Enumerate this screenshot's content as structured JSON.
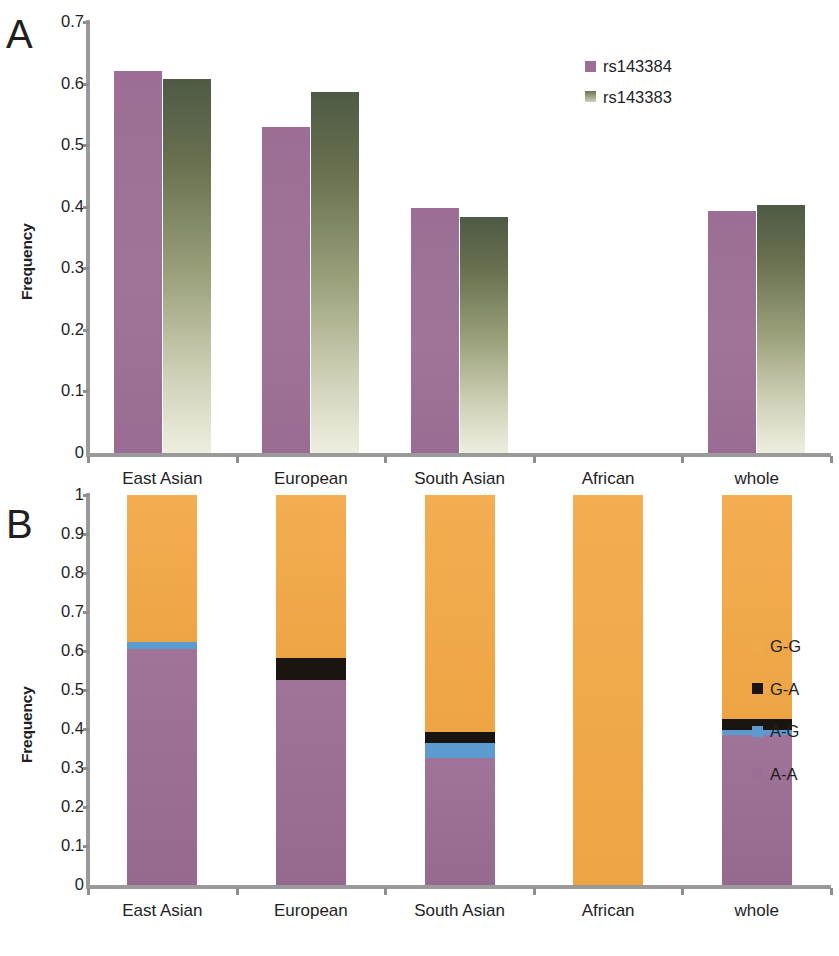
{
  "figure": {
    "panels": [
      {
        "letter": "A",
        "ylabel": "Frequency"
      },
      {
        "letter": "B",
        "ylabel": "Frequency"
      }
    ]
  },
  "chart_data": [
    {
      "type": "bar",
      "panel": "A",
      "title": "",
      "xlabel": "",
      "ylabel": "Frequency",
      "ylim": [
        0,
        0.7
      ],
      "yticks": [
        "0",
        "0.1",
        "0.2",
        "0.3",
        "0.4",
        "0.5",
        "0.6",
        "0.7"
      ],
      "ytick_values": [
        0,
        0.1,
        0.2,
        0.3,
        0.4,
        0.5,
        0.6,
        0.7
      ],
      "grid": false,
      "legend_position": "top-right",
      "categories": [
        "East Asian",
        "European",
        "South Asian",
        "African",
        "whole"
      ],
      "series": [
        {
          "name": "rs143384",
          "color": "#9c6e95",
          "values": [
            0.621,
            0.53,
            0.398,
            0.0,
            0.393
          ]
        },
        {
          "name": "rs143383",
          "color": "#6d7455",
          "values": [
            0.607,
            0.586,
            0.383,
            0.0,
            0.402
          ]
        }
      ]
    },
    {
      "type": "bar",
      "subtype": "stacked",
      "panel": "B",
      "title": "",
      "xlabel": "",
      "ylabel": "Frequency",
      "ylim": [
        0,
        1
      ],
      "yticks": [
        "0",
        "0.1",
        "0.2",
        "0.3",
        "0.4",
        "0.5",
        "0.6",
        "0.7",
        "0.8",
        "0.9",
        "1"
      ],
      "ytick_values": [
        0,
        0.1,
        0.2,
        0.3,
        0.4,
        0.5,
        0.6,
        0.7,
        0.8,
        0.9,
        1
      ],
      "grid": false,
      "legend_position": "right",
      "categories": [
        "East Asian",
        "European",
        "South Asian",
        "African",
        "whole"
      ],
      "series": [
        {
          "name": "A-A",
          "color": "#9c6e95",
          "values": [
            0.605,
            0.525,
            0.325,
            0.0,
            0.385
          ]
        },
        {
          "name": "A-G",
          "color": "#5b9bd0",
          "values": [
            0.017,
            0.0,
            0.038,
            0.0,
            0.013
          ]
        },
        {
          "name": "G-A",
          "color": "#1b1512",
          "values": [
            0.0,
            0.057,
            0.03,
            0.0,
            0.028
          ]
        },
        {
          "name": "G-G",
          "color": "#f0a94b",
          "values": [
            0.378,
            0.418,
            0.607,
            1.0,
            0.574
          ]
        }
      ]
    }
  ]
}
